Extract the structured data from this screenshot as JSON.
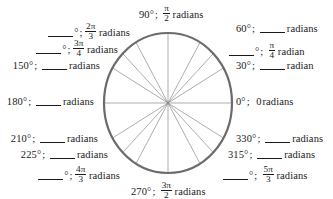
{
  "figure": {
    "type": "unit-circle-worksheet",
    "circle": {
      "center_x": 168,
      "center_y": 103,
      "radius_x": 64,
      "radius_y": 70,
      "stroke_color": "#6b6b6b",
      "stroke_width": 2.2,
      "spoke_color": "#8a8a8a",
      "spoke_width": 0.7,
      "spoke_angles_deg": [
        0,
        30,
        45,
        60,
        90,
        120,
        135,
        150,
        180,
        210,
        225,
        240,
        270,
        300,
        315,
        330
      ]
    },
    "blank_placeholder": "____"
  },
  "labels": [
    {
      "id": "label-120",
      "angle_deg": 120,
      "degrees_text": "",
      "degrees_is_blank": true,
      "degree_symbol": "°",
      "separator": ";",
      "radians_numerator": "2π",
      "radians_denominator": "3",
      "radians_is_blank": false,
      "unit": "radians"
    },
    {
      "id": "label-90",
      "angle_deg": 90,
      "degrees_text": "90",
      "degrees_is_blank": false,
      "degree_symbol": "°",
      "separator": ";",
      "radians_numerator": "π",
      "radians_denominator": "2",
      "radians_is_blank": false,
      "unit": "radians"
    },
    {
      "id": "label-60",
      "angle_deg": 60,
      "degrees_text": "60",
      "degrees_is_blank": false,
      "degree_symbol": "°",
      "separator": ";",
      "radians_numerator": "",
      "radians_denominator": "",
      "radians_is_blank": true,
      "unit": "radians"
    },
    {
      "id": "label-135",
      "angle_deg": 135,
      "degrees_text": "",
      "degrees_is_blank": true,
      "degree_symbol": "°",
      "separator": ";",
      "radians_numerator": "3π",
      "radians_denominator": "4",
      "radians_is_blank": false,
      "unit": "radians"
    },
    {
      "id": "label-45",
      "angle_deg": 45,
      "degrees_text": "",
      "degrees_is_blank": true,
      "degree_symbol": "°",
      "separator": ";",
      "radians_numerator": "π",
      "radians_denominator": "4",
      "radians_is_blank": false,
      "unit": "radian"
    },
    {
      "id": "label-150",
      "angle_deg": 150,
      "degrees_text": "150",
      "degrees_is_blank": false,
      "degree_symbol": "°",
      "separator": ";",
      "radians_numerator": "",
      "radians_denominator": "",
      "radians_is_blank": true,
      "unit": "radians"
    },
    {
      "id": "label-30",
      "angle_deg": 30,
      "degrees_text": "30",
      "degrees_is_blank": false,
      "degree_symbol": "°",
      "separator": ";",
      "radians_numerator": "",
      "radians_denominator": "",
      "radians_is_blank": true,
      "unit": "radian"
    },
    {
      "id": "label-180",
      "angle_deg": 180,
      "degrees_text": "180",
      "degrees_is_blank": false,
      "degree_symbol": "°",
      "separator": ";",
      "radians_numerator": "",
      "radians_denominator": "",
      "radians_is_blank": true,
      "unit": "radians"
    },
    {
      "id": "label-0",
      "angle_deg": 0,
      "degrees_text": "0",
      "degrees_is_blank": false,
      "degree_symbol": "°",
      "separator": ";",
      "radians_value": "0",
      "radians_is_blank": false,
      "unit": "radians"
    },
    {
      "id": "label-210",
      "angle_deg": 210,
      "degrees_text": "210",
      "degrees_is_blank": false,
      "degree_symbol": "°",
      "separator": ";",
      "radians_numerator": "",
      "radians_denominator": "",
      "radians_is_blank": true,
      "unit": "radians"
    },
    {
      "id": "label-330",
      "angle_deg": 330,
      "degrees_text": "330",
      "degrees_is_blank": false,
      "degree_symbol": "°",
      "separator": ";",
      "radians_numerator": "",
      "radians_denominator": "",
      "radians_is_blank": true,
      "unit": "radians"
    },
    {
      "id": "label-225",
      "angle_deg": 225,
      "degrees_text": "225",
      "degrees_is_blank": false,
      "degree_symbol": "°",
      "separator": ";",
      "radians_numerator": "",
      "radians_denominator": "",
      "radians_is_blank": true,
      "unit": "radians"
    },
    {
      "id": "label-315",
      "angle_deg": 315,
      "degrees_text": "315",
      "degrees_is_blank": false,
      "degree_symbol": "°",
      "separator": ";",
      "radians_numerator": "",
      "radians_denominator": "",
      "radians_is_blank": true,
      "unit": "radians"
    },
    {
      "id": "label-240",
      "angle_deg": 240,
      "degrees_text": "",
      "degrees_is_blank": true,
      "degree_symbol": "°",
      "separator": ";",
      "radians_numerator": "4π",
      "radians_denominator": "3",
      "radians_is_blank": false,
      "unit": "radians"
    },
    {
      "id": "label-300",
      "angle_deg": 300,
      "degrees_text": "",
      "degrees_is_blank": true,
      "degree_symbol": "°",
      "separator": ";",
      "radians_numerator": "5π",
      "radians_denominator": "3",
      "radians_is_blank": false,
      "unit": "radians"
    },
    {
      "id": "label-270",
      "angle_deg": 270,
      "degrees_text": "270",
      "degrees_is_blank": false,
      "degree_symbol": "°",
      "separator": ";",
      "radians_numerator": "3π",
      "radians_denominator": "2",
      "radians_is_blank": false,
      "unit": "radians"
    }
  ]
}
